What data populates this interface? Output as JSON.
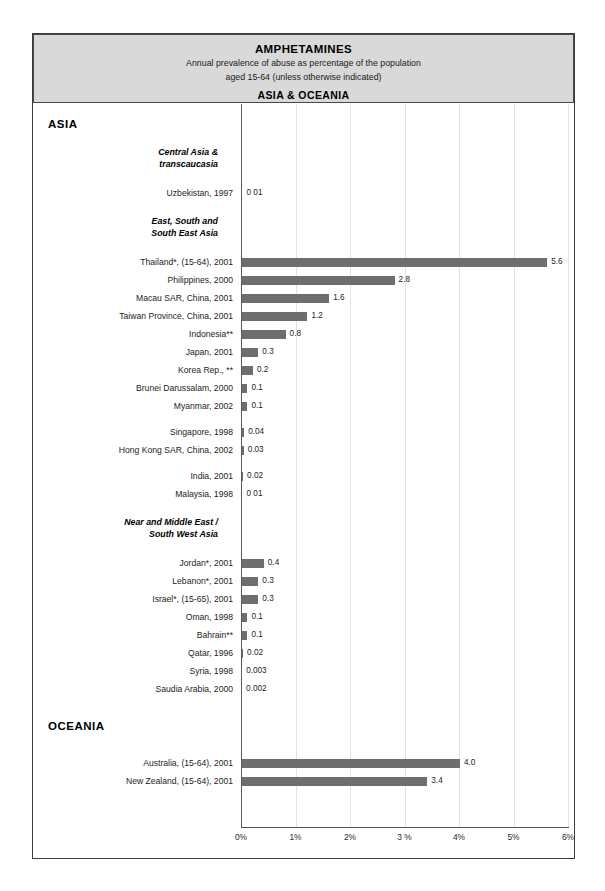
{
  "title": {
    "main": "AMPHETAMINES",
    "subtitle_line1": "Annual prevalence of abuse as percentage of the population",
    "subtitle_line2": "aged 15-64 (unless otherwise indicated)",
    "region": "ASIA & OCEANIA"
  },
  "chart_data": {
    "type": "bar",
    "orientation": "horizontal",
    "title": "AMPHETAMINES",
    "subtitle": "Annual prevalence of abuse as percentage of the population aged 15-64 (unless otherwise indicated)",
    "xlabel": "",
    "ylabel": "",
    "xlim": [
      0,
      6
    ],
    "grid": true,
    "legend": null,
    "tick_labels": [
      "0%",
      "1%",
      "2%",
      "3 %",
      "4%",
      "5%",
      "6%"
    ],
    "tick_values": [
      0,
      1,
      2,
      3,
      4,
      5,
      6
    ],
    "bar_color": "#6e6e6e",
    "sections": [
      {
        "region": "ASIA",
        "groups": [
          {
            "group": "Central Asia &\ntranscaucasia",
            "rows": [
              {
                "label": "Uzbekistan, 1997",
                "value": 0.01,
                "value_label": "0 01"
              }
            ]
          },
          {
            "group": "East, South and\nSouth East Asia",
            "rows": [
              {
                "label": "Thailand*, (15-64),  2001",
                "value": 5.6,
                "value_label": "5.6"
              },
              {
                "label": "Philippines,  2000",
                "value": 2.8,
                "value_label": "2.8"
              },
              {
                "label": "Macau SAR, China, 2001",
                "value": 1.6,
                "value_label": "1.6"
              },
              {
                "label": "Taiwan Province, China, 2001",
                "value": 1.2,
                "value_label": "1.2"
              },
              {
                "label": "Indonesia**",
                "value": 0.8,
                "value_label": "0.8"
              },
              {
                "label": "Japan, 2001",
                "value": 0.3,
                "value_label": "0.3"
              },
              {
                "label": "Korea Rep., **",
                "value": 0.2,
                "value_label": "0.2"
              },
              {
                "label": "Brunei Darussalam, 2000",
                "value": 0.1,
                "value_label": "0.1"
              },
              {
                "label": "Myanmar, 2002",
                "value": 0.1,
                "value_label": "0.1"
              },
              {
                "label": "Singapore, 1998",
                "value": 0.04,
                "value_label": "0.04"
              },
              {
                "label": "Hong Kong SAR, China, 2002",
                "value": 0.03,
                "value_label": "0.03"
              },
              {
                "label": "India, 2001",
                "value": 0.02,
                "value_label": "0.02"
              },
              {
                "label": "Malaysia, 1998",
                "value": 0.01,
                "value_label": "0 01"
              }
            ]
          },
          {
            "group": "Near and Middle East /\nSouth West Asia",
            "rows": [
              {
                "label": "Jordan*, 2001",
                "value": 0.4,
                "value_label": "0.4"
              },
              {
                "label": "Lebanon*, 2001",
                "value": 0.3,
                "value_label": "0.3"
              },
              {
                "label": "Israel*, (15-65), 2001",
                "value": 0.3,
                "value_label": "0.3"
              },
              {
                "label": "Oman, 1998",
                "value": 0.1,
                "value_label": "0.1"
              },
              {
                "label": "Bahrain**",
                "value": 0.1,
                "value_label": "0.1"
              },
              {
                "label": "Qatar, 1996",
                "value": 0.02,
                "value_label": "0.02"
              },
              {
                "label": "Syria, 1998",
                "value": 0.003,
                "value_label": "0.003"
              },
              {
                "label": "Saudia Arabia, 2000",
                "value": 0.002,
                "value_label": "0.002"
              }
            ]
          }
        ]
      },
      {
        "region": "OCEANIA",
        "groups": [
          {
            "group": "",
            "rows": [
              {
                "label": "Australia, (15-64), 2001",
                "value": 4.0,
                "value_label": "4.0"
              },
              {
                "label": "New Zealand, (15-64), 2001",
                "value": 3.4,
                "value_label": "3.4"
              }
            ]
          }
        ]
      }
    ]
  }
}
